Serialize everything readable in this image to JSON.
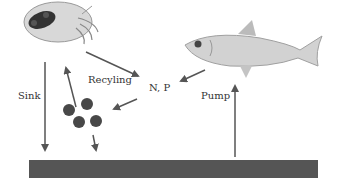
{
  "labels": {
    "sink": "Sink",
    "recycling": "Recyling",
    "nutrients": "N, P",
    "pump": "Pump"
  },
  "organisms": {
    "zooplankton": "zooplankton",
    "fish": "fish"
  },
  "colors": {
    "arrow": "#555555",
    "sediment": "#555555",
    "particles": "#444444"
  }
}
